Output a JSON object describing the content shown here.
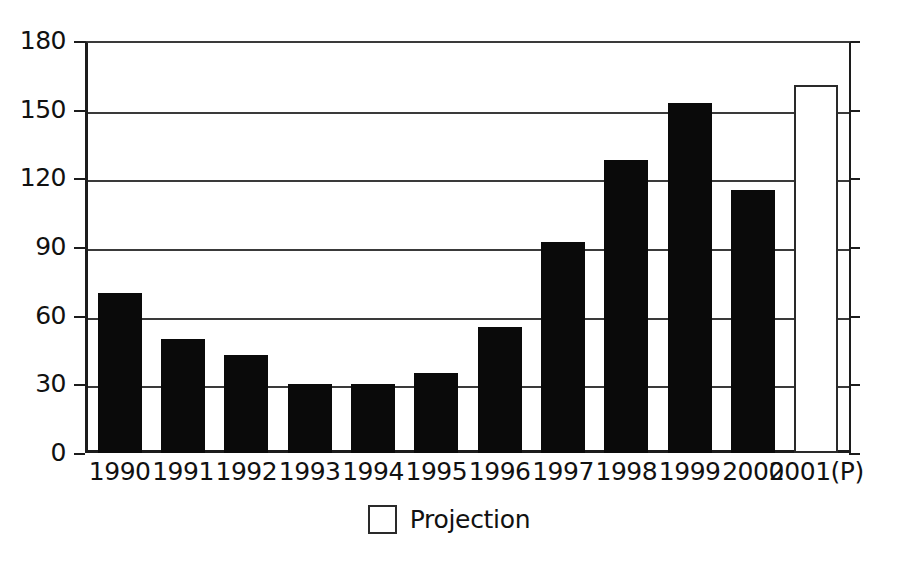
{
  "chart_data": {
    "type": "bar",
    "title": "",
    "subtitle": "",
    "xlabel": "",
    "ylabel": "",
    "categories": [
      "1990",
      "1991",
      "1992",
      "1993",
      "1994",
      "1995",
      "1996",
      "1997",
      "1998",
      "1999",
      "2000",
      "2001(P)"
    ],
    "values": [
      70,
      50,
      43,
      30,
      30,
      35,
      55,
      92,
      128,
      153,
      115,
      161
    ],
    "point_types": [
      "actual",
      "actual",
      "actual",
      "actual",
      "actual",
      "actual",
      "actual",
      "actual",
      "actual",
      "actual",
      "actual",
      "projection"
    ],
    "ylim": [
      0,
      180
    ],
    "ytick_labels": [
      "180",
      "150",
      "120",
      "90",
      "60",
      "30",
      "0"
    ],
    "ytick_values": [
      180,
      150,
      120,
      90,
      60,
      30,
      0
    ],
    "grid": true,
    "grid_axis": "y",
    "legend": [
      {
        "label": "Projection",
        "swatch": "hollow-square",
        "color": "#ffffff",
        "border_color": "#2a2a2a"
      }
    ],
    "legend_position": "bottom-center",
    "colors": {
      "bar_actual": "#0a0a0a",
      "bar_projection_fill": "#ffffff",
      "bar_projection_border": "#2a2a2a",
      "axis": "#1c1c1c",
      "gridline": "#3a3a3a",
      "text": "#111111",
      "background": "#ffffff"
    }
  }
}
